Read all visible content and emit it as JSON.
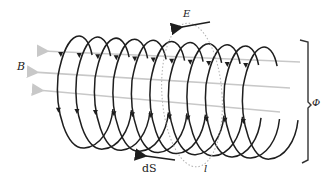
{
  "diagram": {
    "labels": {
      "B": "B",
      "E": "E",
      "phi": "Φ",
      "dS": "dS",
      "l": "l"
    },
    "colors": {
      "coil": "#1e1e1e",
      "field_lines": "#c8c8c8",
      "loop_dashed": "#b0b0b0",
      "bracket": "#333333",
      "arrow": "#1e1e1e"
    },
    "coil": {
      "turns": 11,
      "first_center_x": 80,
      "spacing": 18.5,
      "center_y_start": 88,
      "center_y_slope": 0.06,
      "rx": 22,
      "ry": 60
    },
    "field_lines": [
      {
        "x1": 300,
        "y1": 62,
        "x2": 42,
        "y2": 51
      },
      {
        "x1": 290,
        "y1": 88,
        "x2": 32,
        "y2": 72
      },
      {
        "x1": 280,
        "y1": 112,
        "x2": 37,
        "y2": 90
      }
    ]
  }
}
